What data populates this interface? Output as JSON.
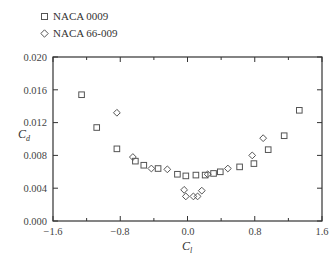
{
  "legend": {
    "items": [
      {
        "label": "NACA 0009",
        "marker": "square"
      },
      {
        "label": "NACA 66-009",
        "marker": "diamond"
      }
    ]
  },
  "axes": {
    "xlabel_main": "C",
    "xlabel_sub": "l",
    "ylabel_main": "C",
    "ylabel_sub": "d",
    "xticks": [
      "−1.6",
      "−0.8",
      "0.0",
      "0.8",
      "1.6"
    ],
    "yticks": [
      "0.000",
      "0.004",
      "0.008",
      "0.012",
      "0.016",
      "0.020"
    ]
  },
  "chart_data": {
    "type": "scatter",
    "title": "",
    "xlabel": "C_l",
    "ylabel": "C_d",
    "xlim": [
      -1.6,
      1.6
    ],
    "ylim": [
      0.0,
      0.02
    ],
    "grid": false,
    "legend_position": "top-left, outside plot",
    "x_ticks": [
      -1.6,
      -0.8,
      0.0,
      0.8,
      1.6
    ],
    "x_minor_ticks": [
      -1.2,
      -0.4,
      0.4,
      1.2
    ],
    "y_ticks": [
      0.0,
      0.004,
      0.008,
      0.012,
      0.016,
      0.02
    ],
    "series": [
      {
        "name": "NACA 0009",
        "marker": "square",
        "points": [
          [
            -1.26,
            0.0154
          ],
          [
            -1.08,
            0.0114
          ],
          [
            -0.84,
            0.0088
          ],
          [
            -0.62,
            0.0073
          ],
          [
            -0.52,
            0.0068
          ],
          [
            -0.35,
            0.0064
          ],
          [
            -0.12,
            0.0057
          ],
          [
            -0.02,
            0.0055
          ],
          [
            0.1,
            0.0056
          ],
          [
            0.21,
            0.0056
          ],
          [
            0.31,
            0.0058
          ],
          [
            0.39,
            0.006
          ],
          [
            0.62,
            0.0066
          ],
          [
            0.79,
            0.007
          ],
          [
            0.96,
            0.0087
          ],
          [
            1.15,
            0.0104
          ],
          [
            1.33,
            0.0135
          ]
        ]
      },
      {
        "name": "NACA 66-009",
        "marker": "diamond",
        "points": [
          [
            -0.84,
            0.0132
          ],
          [
            -0.65,
            0.0078
          ],
          [
            -0.24,
            0.0063
          ],
          [
            -0.43,
            0.0064
          ],
          [
            -0.04,
            0.0038
          ],
          [
            -0.02,
            0.003
          ],
          [
            0.07,
            0.003
          ],
          [
            0.12,
            0.003
          ],
          [
            0.17,
            0.0037
          ],
          [
            0.24,
            0.0057
          ],
          [
            0.48,
            0.0064
          ],
          [
            0.77,
            0.008
          ],
          [
            0.9,
            0.0101
          ]
        ]
      }
    ]
  }
}
